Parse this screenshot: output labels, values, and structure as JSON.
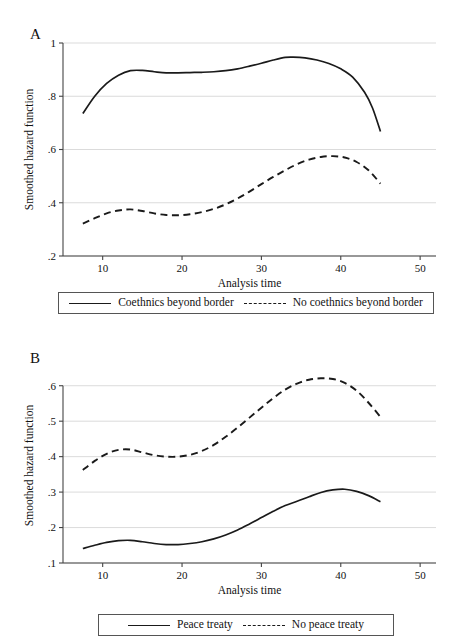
{
  "figure": {
    "panels": [
      {
        "id": "A",
        "letter": "A",
        "chart_data": {
          "type": "line",
          "title": "",
          "xlabel": "Analysis time",
          "ylabel": "Smoothed hazard function",
          "xlim": [
            5,
            52
          ],
          "ylim": [
            0.2,
            1.0
          ],
          "xticks": [
            10,
            20,
            30,
            40,
            50
          ],
          "xticklabels": [
            "10",
            "20",
            "30",
            "40",
            "50"
          ],
          "yticks": [
            0.2,
            0.4,
            0.6,
            0.8,
            1.0
          ],
          "yticklabels": [
            ".2",
            ".4",
            ".6",
            ".8",
            "1"
          ],
          "grid": "horizontal",
          "legend_position": "below",
          "series": [
            {
              "name": "Coethnics beyond border",
              "style": "solid",
              "x": [
                7.5,
                9,
                10.5,
                12,
                13.5,
                15,
                16.5,
                18,
                19.5,
                21,
                22.5,
                24,
                25.5,
                27,
                28.5,
                30,
                31.5,
                33,
                34,
                35.5,
                37,
                38.5,
                40,
                41.5,
                43,
                44,
                45
              ],
              "y": [
                0.735,
                0.8,
                0.848,
                0.879,
                0.896,
                0.897,
                0.892,
                0.888,
                0.888,
                0.889,
                0.89,
                0.892,
                0.896,
                0.903,
                0.913,
                0.924,
                0.936,
                0.946,
                0.947,
                0.944,
                0.936,
                0.923,
                0.903,
                0.872,
                0.815,
                0.756,
                0.668
              ]
            },
            {
              "name": "No coethnics beyond border",
              "style": "dashed",
              "x": [
                7.5,
                9,
                10.5,
                12,
                13.5,
                15,
                16.5,
                18,
                19.5,
                21,
                22.5,
                24,
                25.5,
                27,
                28.5,
                30,
                31.5,
                33,
                34.5,
                36,
                37.5,
                39,
                40.5,
                42,
                43.5,
                45
              ],
              "y": [
                0.322,
                0.342,
                0.36,
                0.371,
                0.375,
                0.369,
                0.36,
                0.354,
                0.353,
                0.357,
                0.365,
                0.377,
                0.394,
                0.416,
                0.442,
                0.47,
                0.497,
                0.522,
                0.545,
                0.562,
                0.572,
                0.575,
                0.57,
                0.553,
                0.522,
                0.472
              ]
            }
          ]
        },
        "legend": [
          {
            "label": "Coethnics beyond border",
            "style": "solid"
          },
          {
            "label": "No coethnics beyond border",
            "style": "dashed"
          }
        ]
      },
      {
        "id": "B",
        "letter": "B",
        "chart_data": {
          "type": "line",
          "title": "",
          "xlabel": "Analysis time",
          "ylabel": "Smoothed hazard function",
          "xlim": [
            5,
            52
          ],
          "ylim": [
            0.1,
            0.65
          ],
          "xticks": [
            10,
            20,
            30,
            40,
            50
          ],
          "xticklabels": [
            "10",
            "20",
            "30",
            "40",
            "50"
          ],
          "yticks": [
            0.1,
            0.2,
            0.3,
            0.4,
            0.5,
            0.6
          ],
          "yticklabels": [
            ".1",
            ".2",
            ".3",
            ".4",
            ".5",
            ".6"
          ],
          "grid": "horizontal",
          "legend_position": "below",
          "series": [
            {
              "name": "Peace treaty",
              "style": "solid",
              "x": [
                7.5,
                9,
                10.5,
                12,
                13.5,
                15,
                16.5,
                18,
                19.5,
                21,
                22.5,
                24,
                25.5,
                27,
                28.5,
                30,
                31.5,
                33,
                34.5,
                36,
                37.5,
                39,
                40.5,
                42,
                43.5,
                45
              ],
              "y": [
                0.141,
                0.15,
                0.158,
                0.163,
                0.164,
                0.16,
                0.155,
                0.152,
                0.152,
                0.155,
                0.16,
                0.168,
                0.179,
                0.193,
                0.21,
                0.228,
                0.246,
                0.262,
                0.274,
                0.287,
                0.299,
                0.306,
                0.308,
                0.302,
                0.29,
                0.273
              ]
            },
            {
              "name": "No peace treaty",
              "style": "dashed",
              "x": [
                7.5,
                9,
                10.5,
                12,
                13.5,
                15,
                16.5,
                18,
                19.5,
                21,
                22.5,
                24,
                25.5,
                27,
                28.5,
                30,
                31.5,
                33,
                34.5,
                36,
                37.5,
                39,
                40.5,
                42,
                43.5,
                45
              ],
              "y": [
                0.362,
                0.388,
                0.408,
                0.419,
                0.42,
                0.412,
                0.404,
                0.4,
                0.4,
                0.405,
                0.416,
                0.433,
                0.456,
                0.482,
                0.51,
                0.538,
                0.565,
                0.589,
                0.606,
                0.617,
                0.621,
                0.619,
                0.608,
                0.586,
                0.552,
                0.512
              ]
            }
          ]
        },
        "legend": [
          {
            "label": "Peace treaty",
            "style": "solid"
          },
          {
            "label": "No peace treaty",
            "style": "dashed"
          }
        ]
      }
    ]
  }
}
